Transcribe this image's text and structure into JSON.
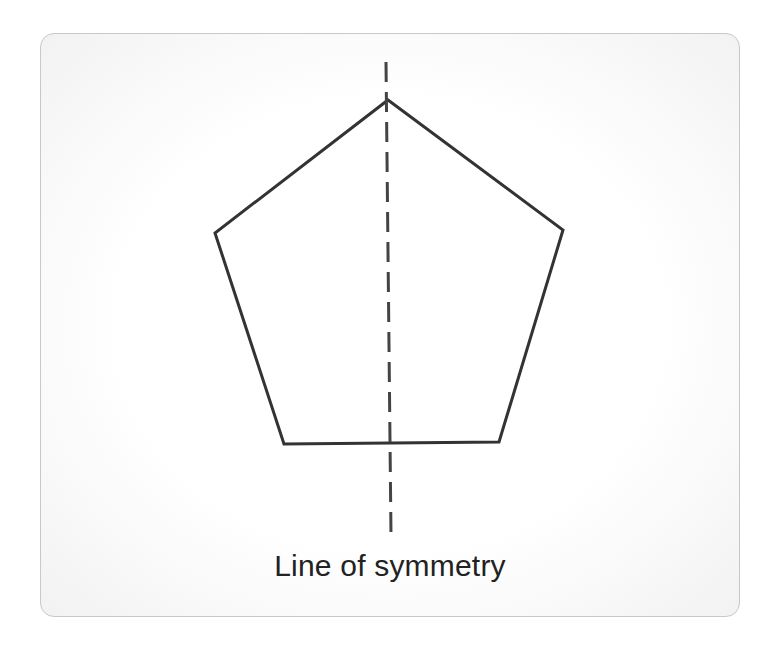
{
  "diagram": {
    "shape": "regular-pentagon",
    "caption": "Line of symmetry",
    "colors": {
      "stroke": "#333333",
      "axis": "#444444",
      "card_border": "#c8c8c8",
      "text": "#222222"
    },
    "pentagon_points": "388,100 563,230 499,442 284,444 215,233",
    "axis": {
      "x1": 386,
      "y1": 62,
      "x2": 391,
      "y2": 535,
      "dash": "20 10"
    }
  }
}
